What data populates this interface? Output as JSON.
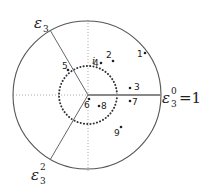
{
  "diagram": {
    "type": "unit-circle-roots-of-unity",
    "colors": {
      "outer_circle": "#555555",
      "inner_dotted_circle": "#333333",
      "axis_dotted": "#aaaaaa",
      "ray_positive_real": "#888888",
      "ray_roots": "#666666",
      "text": "#222222"
    },
    "outer_circle": {
      "cx": 87,
      "cy": 95,
      "r": 74
    },
    "inner_circle": {
      "cx": 88,
      "cy": 95,
      "r": 29,
      "style": "dotted"
    },
    "roots": [
      {
        "id": "eps0",
        "symbol": "ε",
        "subscript": "3",
        "superscript": "0",
        "suffix": "=1",
        "label_x": 162,
        "label_y": 104
      },
      {
        "id": "eps1",
        "symbol": "ε",
        "subscript": "3",
        "superscript": "",
        "suffix": "",
        "label_x": 36,
        "label_y": 26
      },
      {
        "id": "eps2",
        "symbol": "ε",
        "subscript": "3",
        "superscript": "2",
        "suffix": "",
        "label_x": 33,
        "label_y": 178
      }
    ],
    "imag_unit_label": {
      "text": "i",
      "x": 92,
      "y": 64
    },
    "points": [
      {
        "label": "1",
        "x": 145,
        "y": 53,
        "lx": 137,
        "ly": 57
      },
      {
        "label": "2",
        "x": 113,
        "y": 61,
        "lx": 106,
        "ly": 58
      },
      {
        "label": "3",
        "x": 130,
        "y": 88,
        "lx": 134,
        "ly": 90
      },
      {
        "label": "4",
        "x": 101,
        "y": 63,
        "lx": 93,
        "ly": 66
      },
      {
        "label": "5",
        "x": 68,
        "y": 70,
        "lx": 62,
        "ly": 69
      },
      {
        "label": "6",
        "x": 89,
        "y": 99,
        "lx": 84,
        "ly": 108
      },
      {
        "label": "7",
        "x": 130,
        "y": 101,
        "lx": 132,
        "ly": 105
      },
      {
        "label": "8",
        "x": 99,
        "y": 106,
        "lx": 101,
        "ly": 109
      },
      {
        "label": "9",
        "x": 121,
        "y": 127,
        "lx": 114,
        "ly": 136
      }
    ]
  }
}
